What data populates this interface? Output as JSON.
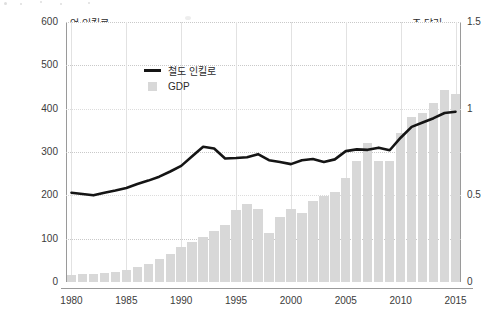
{
  "chart_data": {
    "type": "bar",
    "title": "",
    "subtitle": "",
    "xlabel": "",
    "ylabel": "억 인킬로",
    "y2label": "조 달러",
    "ylim": [
      0,
      600
    ],
    "y2lim": [
      0,
      1.5
    ],
    "grid": true,
    "legend_position": "top-left-inside",
    "x": [
      1980,
      1981,
      1982,
      1983,
      1984,
      1985,
      1986,
      1987,
      1988,
      1989,
      1990,
      1991,
      1992,
      1993,
      1994,
      1995,
      1996,
      1997,
      1998,
      1999,
      2000,
      2001,
      2002,
      2003,
      2004,
      2005,
      2006,
      2007,
      2008,
      2009,
      2010,
      2011,
      2012,
      2013,
      2014,
      2015
    ],
    "xticks": [
      "1980",
      "1985",
      "1990",
      "1995",
      "2000",
      "2005",
      "2010",
      "2015"
    ],
    "yticks_left": [
      "0",
      "100",
      "200",
      "300",
      "400",
      "500",
      "600"
    ],
    "yticks_right": [
      "0",
      "0.5",
      "1",
      "1.5"
    ],
    "series": [
      {
        "name": "GDP",
        "type": "bar",
        "axis": "right",
        "unit": "조 달러",
        "color": "#d8d8d8",
        "values": [
          0.042,
          0.047,
          0.047,
          0.053,
          0.06,
          0.07,
          0.085,
          0.105,
          0.135,
          0.16,
          0.2,
          0.23,
          0.26,
          0.295,
          0.33,
          0.415,
          0.45,
          0.42,
          0.28,
          0.375,
          0.42,
          0.4,
          0.465,
          0.495,
          0.52,
          0.6,
          0.7,
          0.8,
          0.7,
          0.7,
          0.86,
          0.95,
          0.975,
          1.03,
          1.11,
          1.085
        ]
      },
      {
        "name": "철도 인킬로",
        "type": "line",
        "axis": "left",
        "unit": "억 인킬로",
        "color": "#151515",
        "values": [
          206,
          203,
          200,
          206,
          211,
          217,
          226,
          234,
          243,
          255,
          268,
          290,
          312,
          308,
          285,
          286,
          288,
          295,
          281,
          277,
          272,
          281,
          284,
          277,
          283,
          302,
          306,
          305,
          310,
          304,
          333,
          358,
          368,
          378,
          390,
          393
        ]
      }
    ]
  },
  "legend": {
    "items": [
      {
        "label": "철도 인킬로",
        "marker": "line",
        "color": "#151515"
      },
      {
        "label": "GDP",
        "marker": "swatch",
        "color": "#d8d8d8"
      }
    ]
  },
  "axes": {
    "left_unit": "억 인킬로",
    "right_unit": "조 달러"
  }
}
